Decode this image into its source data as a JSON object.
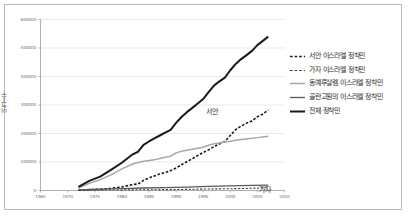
{
  "chart_data": {
    "type": "line",
    "title": "",
    "xlabel": "",
    "ylabel": "인구수",
    "xlim": [
      1965,
      2010
    ],
    "ylim": [
      0,
      600000
    ],
    "grid": true,
    "legend_position": "right",
    "xticks": [
      1965,
      1970,
      1975,
      1980,
      1985,
      1990,
      1995,
      2000,
      2005,
      2010
    ],
    "yticks": [
      0,
      100000,
      200000,
      300000,
      400000,
      500000,
      600000
    ],
    "ytick_labels": [
      "0",
      "100000",
      "200000",
      "300000",
      "400000",
      "500000",
      "600000"
    ],
    "xtick_labels": [
      "1965",
      "1970",
      "1975",
      "1980",
      "1985",
      "1990",
      "1995",
      "2000",
      "2005",
      "2010"
    ],
    "annotations": [
      {
        "text": "서안",
        "x": 2002,
        "y": 315000
      },
      {
        "text": "가자",
        "x": 2006,
        "y": 14000
      }
    ],
    "series": [
      {
        "name": "서안 이스라엘 정착민",
        "style": "dashed",
        "color": "#1a1a1a",
        "width": 1.6,
        "x": [
          1972,
          1974,
          1976,
          1978,
          1980,
          1982,
          1983,
          1984,
          1985,
          1986,
          1987,
          1988,
          1989,
          1990,
          1991,
          1992,
          1993,
          1994,
          1995,
          1996,
          1997,
          1998,
          1999,
          2000,
          2001,
          2002,
          2003,
          2004,
          2005,
          2006,
          2007
        ],
        "y": [
          1200,
          3200,
          4400,
          7400,
          12400,
          21000,
          22800,
          35300,
          44100,
          51000,
          57900,
          63600,
          69800,
          78600,
          90300,
          101100,
          111600,
          122700,
          133200,
          142700,
          154400,
          163300,
          172250,
          192976,
          213672,
          226028,
          236381,
          243933,
          258988,
          268400,
          282000
        ]
      },
      {
        "name": "가자 이스라엘 정착민",
        "style": "dashed",
        "color": "#3d3d3d",
        "width": 1.1,
        "x": [
          1972,
          1975,
          1978,
          1980,
          1982,
          1985,
          1987,
          1990,
          1993,
          1996,
          1999,
          2001,
          2003,
          2005,
          2006,
          2007
        ],
        "y": [
          700,
          1000,
          1800,
          2000,
          2300,
          2700,
          2900,
          3300,
          4300,
          5300,
          6100,
          6500,
          7200,
          8500,
          9500,
          10000
        ]
      },
      {
        "name": "동예루살렘 이스라엘 정착민",
        "style": "solid",
        "color": "#a8a8a8",
        "width": 1.5,
        "x": [
          1972,
          1974,
          1976,
          1978,
          1980,
          1982,
          1983,
          1984,
          1985,
          1986,
          1987,
          1988,
          1989,
          1990,
          1991,
          1992,
          1993,
          1994,
          1995,
          1996,
          1997,
          1998,
          1999,
          2000,
          2001,
          2002,
          2003,
          2004,
          2005,
          2006,
          2007
        ],
        "y": [
          8700,
          25000,
          38000,
          55000,
          76000,
          93000,
          98000,
          103000,
          105000,
          107500,
          112000,
          117000,
          120000,
          132000,
          138000,
          141500,
          145000,
          148000,
          152000,
          159000,
          164000,
          167000,
          170000,
          173000,
          176000,
          179000,
          181000,
          183000,
          185500,
          188000,
          190000
        ]
      },
      {
        "name": "골란고원의 이스라엘 정착민",
        "style": "solid",
        "color": "#5a5a5a",
        "width": 1.3,
        "x": [
          1972,
          1976,
          1980,
          1984,
          1988,
          1992,
          1996,
          2000,
          2004,
          2007
        ],
        "y": [
          2000,
          4500,
          6800,
          8700,
          10000,
          12000,
          14500,
          16500,
          18000,
          19000
        ]
      },
      {
        "name": "전체 정착민",
        "style": "solid",
        "color": "#1a1a1a",
        "width": 2.0,
        "x": [
          1972,
          1974,
          1976,
          1978,
          1980,
          1982,
          1983,
          1984,
          1985,
          1986,
          1987,
          1988,
          1989,
          1990,
          1991,
          1992,
          1993,
          1994,
          1995,
          1996,
          1997,
          1998,
          1999,
          2000,
          2001,
          2002,
          2003,
          2004,
          2005,
          2006,
          2007
        ],
        "y": [
          12600,
          33700,
          48700,
          72200,
          97500,
          127000,
          136000,
          160000,
          172000,
          182500,
          193000,
          203000,
          213000,
          237000,
          258000,
          275000,
          290000,
          305000,
          321000,
          345000,
          368000,
          383000,
          396000,
          422000,
          444000,
          461000,
          475000,
          490000,
          510000,
          525000,
          540000
        ]
      }
    ]
  }
}
